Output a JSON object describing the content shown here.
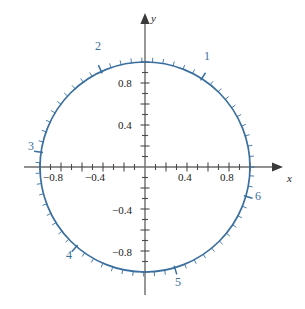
{
  "figure": {
    "title": "",
    "background_color": "#ffffff",
    "width": 305,
    "height": 309
  },
  "axes": {
    "x_axis_name": "x",
    "y_axis_name": "y",
    "axis_color": "#6b6b6b",
    "origin_px": {
      "x": 145,
      "y": 167
    },
    "pixels_per_unit": 105,
    "x_tick_labels": [
      {
        "text": "−0.8",
        "value": -0.8
      },
      {
        "text": "−0.4",
        "value": -0.4
      },
      {
        "text": "0.4",
        "value": 0.4
      },
      {
        "text": "0.8",
        "value": 0.8
      }
    ],
    "y_tick_labels": [
      {
        "text": "0.8",
        "value": 0.8
      },
      {
        "text": "0.4",
        "value": 0.4
      },
      {
        "text": "−0.4",
        "value": -0.4
      },
      {
        "text": "−0.8",
        "value": -0.8
      }
    ],
    "minor_tick_step": 0.1,
    "x_range": [
      -1.12,
      1.12
    ],
    "y_range": [
      -1.12,
      1.12
    ]
  },
  "chart_data": {
    "type": "line",
    "title": "",
    "subtitle": "",
    "xlabel": "x",
    "ylabel": "y",
    "xlim": [
      -1.12,
      1.12
    ],
    "ylim": [
      -1.12,
      1.12
    ],
    "grid": false,
    "legend": "none",
    "curve_color": "#3a6f9f",
    "series": [
      {
        "name": "unit circle",
        "equation": "x^2 + y^2 = 1",
        "radius": 1,
        "center": [
          0,
          0
        ]
      }
    ],
    "radian_ticks": {
      "description": "radial tick marks along the unit circle at 0.1 radian intervals, long ticks at each integer radian",
      "minor_step_radians": 0.1,
      "major_step_radians": 1,
      "total_radians": 6.283185
    },
    "annotations": [
      {
        "label": "1",
        "radians": 1,
        "x": 0.5403,
        "y": 0.8415,
        "label_px": {
          "x": 204,
          "y": 50
        }
      },
      {
        "label": "2",
        "radians": 2,
        "x": -0.4161,
        "y": 0.9093,
        "label_px": {
          "x": 95,
          "y": 40
        }
      },
      {
        "label": "3",
        "radians": 3,
        "x": -0.99,
        "y": 0.1411,
        "label_px": {
          "x": 28,
          "y": 140
        }
      },
      {
        "label": "4",
        "radians": 4,
        "x": -0.6536,
        "y": -0.7568,
        "label_px": {
          "x": 66,
          "y": 249
        }
      },
      {
        "label": "5",
        "radians": 5,
        "x": 0.2837,
        "y": -0.9589,
        "label_px": {
          "x": 175,
          "y": 276
        }
      },
      {
        "label": "6",
        "radians": 6,
        "x": 0.96,
        "y": -0.2794,
        "label_px": {
          "x": 255,
          "y": 190
        }
      }
    ],
    "annotation_color": "#3a6f9f"
  }
}
